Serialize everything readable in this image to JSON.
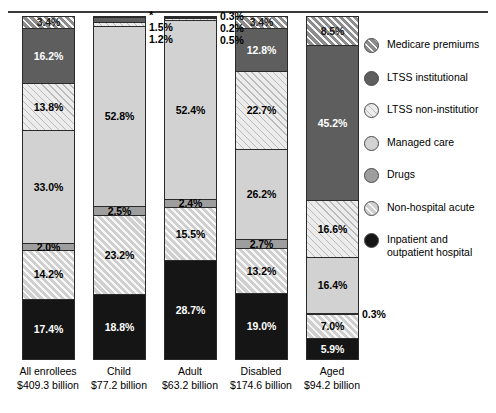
{
  "chart_data": {
    "type": "bar",
    "subtype": "stacked-percentage",
    "title": "",
    "subtitle": "",
    "xlabel": "",
    "ylabel": "",
    "ylim": [
      0,
      100
    ],
    "grid": false,
    "legend_position": "right",
    "categories": [
      "All enrollees",
      "Child",
      "Adult",
      "Disabled",
      "Aged"
    ],
    "category_amounts": [
      "$409.3 billion",
      "$77.2 billion",
      "$63.2 billion",
      "$174.6 billion",
      "$94.2 billion"
    ],
    "series": [
      {
        "name": "Medicare premiums",
        "key": "medicare",
        "values": [
          3.4,
          null,
          0.3,
          3.4,
          8.5
        ]
      },
      {
        "name": "LTSS institutional",
        "key": "ltss_inst",
        "values": [
          16.2,
          1.5,
          0.2,
          12.8,
          45.2
        ]
      },
      {
        "name": "LTSS non-institutional",
        "key": "ltss_non",
        "values": [
          13.8,
          1.2,
          0.5,
          22.7,
          16.6
        ]
      },
      {
        "name": "Managed care",
        "key": "managed",
        "values": [
          33.0,
          52.8,
          52.4,
          26.2,
          16.4
        ]
      },
      {
        "name": "Drugs",
        "key": "drugs",
        "values": [
          2.0,
          2.5,
          2.4,
          2.7,
          0.3
        ]
      },
      {
        "name": "Non-hospital acute",
        "key": "nonhosp",
        "values": [
          14.2,
          23.2,
          15.5,
          13.2,
          7.0
        ]
      },
      {
        "name": "Inpatient and outpatient hospital",
        "key": "inpatient",
        "values": [
          17.4,
          18.8,
          28.7,
          19.0,
          5.9
        ]
      }
    ],
    "annotations": {
      "child_medicare_marker": "*"
    }
  },
  "bars": [
    {
      "id": "all-enrollees",
      "category": "All enrollees",
      "amount": "$409.3 billion",
      "segments": [
        {
          "key": "medicare",
          "label": "3.4%",
          "pct": 3.4,
          "inside": true,
          "fill": "f-medicare"
        },
        {
          "key": "ltss_inst",
          "label": "16.2%",
          "pct": 16.2,
          "inside": true,
          "fill": "f-ltss-inst"
        },
        {
          "key": "ltss_non",
          "label": "13.8%",
          "pct": 13.8,
          "inside": true,
          "fill": "f-ltss-non"
        },
        {
          "key": "managed",
          "label": "33.0%",
          "pct": 33.0,
          "inside": true,
          "fill": "f-managed"
        },
        {
          "key": "drugs",
          "label": "2.0%",
          "pct": 2.0,
          "inside": true,
          "fill": "f-drugs"
        },
        {
          "key": "nonhosp",
          "label": "14.2%",
          "pct": 14.2,
          "inside": true,
          "fill": "f-nonhosp"
        },
        {
          "key": "inpatient",
          "label": "17.4%",
          "pct": 17.4,
          "inside": true,
          "fill": "f-inpatient"
        }
      ]
    },
    {
      "id": "child",
      "category": "Child",
      "amount": "$77.2 billion",
      "segments": [
        {
          "key": "medicare",
          "label": "*",
          "pct": 0.2,
          "inside": false,
          "fill": "f-medicare"
        },
        {
          "key": "ltss_inst",
          "label": "1.5%",
          "pct": 1.5,
          "inside": false,
          "fill": "f-ltss-inst"
        },
        {
          "key": "ltss_non",
          "label": "1.2%",
          "pct": 1.2,
          "inside": false,
          "fill": "f-ltss-non"
        },
        {
          "key": "managed",
          "label": "52.8%",
          "pct": 52.8,
          "inside": true,
          "fill": "f-managed"
        },
        {
          "key": "drugs",
          "label": "2.5%",
          "pct": 2.5,
          "inside": true,
          "fill": "f-drugs"
        },
        {
          "key": "nonhosp",
          "label": "23.2%",
          "pct": 23.2,
          "inside": true,
          "fill": "f-nonhosp"
        },
        {
          "key": "inpatient",
          "label": "18.8%",
          "pct": 18.8,
          "inside": true,
          "fill": "f-inpatient"
        }
      ]
    },
    {
      "id": "adult",
      "category": "Adult",
      "amount": "$63.2 billion",
      "segments": [
        {
          "key": "medicare",
          "label": "0.3%",
          "pct": 0.3,
          "inside": false,
          "fill": "f-medicare"
        },
        {
          "key": "ltss_inst",
          "label": "0.2%",
          "pct": 0.2,
          "inside": false,
          "fill": "f-ltss-inst"
        },
        {
          "key": "ltss_non",
          "label": "0.5%",
          "pct": 0.5,
          "inside": false,
          "fill": "f-ltss-non"
        },
        {
          "key": "managed",
          "label": "52.4%",
          "pct": 52.4,
          "inside": true,
          "fill": "f-managed"
        },
        {
          "key": "drugs",
          "label": "2.4%",
          "pct": 2.4,
          "inside": true,
          "fill": "f-drugs"
        },
        {
          "key": "nonhosp",
          "label": "15.5%",
          "pct": 15.5,
          "inside": true,
          "fill": "f-nonhosp"
        },
        {
          "key": "inpatient",
          "label": "28.7%",
          "pct": 28.7,
          "inside": true,
          "fill": "f-inpatient"
        }
      ]
    },
    {
      "id": "disabled",
      "category": "Disabled",
      "amount": "$174.6 billion",
      "segments": [
        {
          "key": "medicare",
          "label": "3.4%",
          "pct": 3.4,
          "inside": true,
          "fill": "f-medicare"
        },
        {
          "key": "ltss_inst",
          "label": "12.8%",
          "pct": 12.8,
          "inside": true,
          "fill": "f-ltss-inst"
        },
        {
          "key": "ltss_non",
          "label": "22.7%",
          "pct": 22.7,
          "inside": true,
          "fill": "f-ltss-non"
        },
        {
          "key": "managed",
          "label": "26.2%",
          "pct": 26.2,
          "inside": true,
          "fill": "f-managed"
        },
        {
          "key": "drugs",
          "label": "2.7%",
          "pct": 2.7,
          "inside": true,
          "fill": "f-drugs"
        },
        {
          "key": "nonhosp",
          "label": "13.2%",
          "pct": 13.2,
          "inside": true,
          "fill": "f-nonhosp"
        },
        {
          "key": "inpatient",
          "label": "19.0%",
          "pct": 19.0,
          "inside": true,
          "fill": "f-inpatient"
        }
      ]
    },
    {
      "id": "aged",
      "category": "Aged",
      "amount": "$94.2 billion",
      "segments": [
        {
          "key": "medicare",
          "label": "8.5%",
          "pct": 8.5,
          "inside": true,
          "fill": "f-medicare"
        },
        {
          "key": "ltss_inst",
          "label": "45.2%",
          "pct": 45.2,
          "inside": true,
          "fill": "f-ltss-inst"
        },
        {
          "key": "ltss_non",
          "label": "16.6%",
          "pct": 16.6,
          "inside": true,
          "fill": "f-ltss-non"
        },
        {
          "key": "managed",
          "label": "16.4%",
          "pct": 16.4,
          "inside": true,
          "fill": "f-managed"
        },
        {
          "key": "drugs",
          "label": "0.3%",
          "pct": 0.3,
          "inside": false,
          "fill": "f-drugs"
        },
        {
          "key": "nonhosp",
          "label": "7.0%",
          "pct": 7.0,
          "inside": true,
          "fill": "f-nonhosp"
        },
        {
          "key": "inpatient",
          "label": "5.9%",
          "pct": 5.9,
          "inside": true,
          "fill": "f-inpatient"
        }
      ]
    }
  ],
  "legend": {
    "items": [
      {
        "label": "Medicare premiums",
        "fill": "f-medicare"
      },
      {
        "label": "LTSS institutional",
        "fill": "f-ltss-inst"
      },
      {
        "label": "LTSS non-institutior",
        "fill": "f-ltss-non"
      },
      {
        "label": "Managed care",
        "fill": "f-managed"
      },
      {
        "label": "Drugs",
        "fill": "f-drugs"
      },
      {
        "label": "Non-hospital acute",
        "fill": "f-nonhosp"
      },
      {
        "label": "Inpatient and\noutpatient hospital",
        "fill": "f-inpatient"
      }
    ]
  },
  "colors": {
    "medicare": "#8c8c8c",
    "ltss_inst": "#5e5e5e",
    "ltss_non": "#ececec",
    "managed": "#d2d2d2",
    "drugs": "#9e9e9e",
    "nonhosp": "#cfcfcf",
    "inpatient": "#151515",
    "outline": "#2b2b2b",
    "background": "#ffffff"
  }
}
